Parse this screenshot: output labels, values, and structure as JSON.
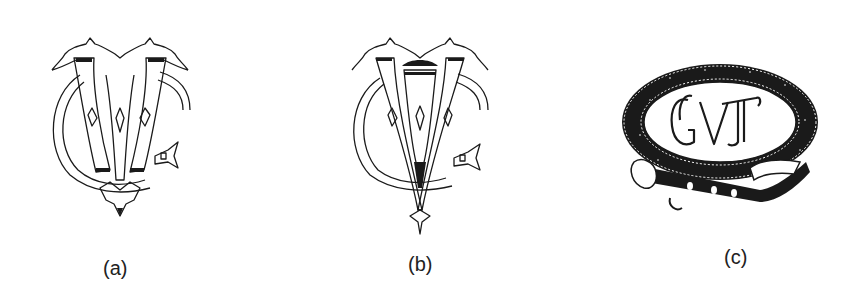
{
  "figure": {
    "panels": [
      {
        "id": "a",
        "label": "(a)",
        "description": "Ornate interlaced monogram with a C-shaped ring, twin stems and a pointed base"
      },
      {
        "id": "b",
        "label": "(b)",
        "description": "Variant of the ornate monogram with a V-shaped stem ending in an arrow point"
      },
      {
        "id": "c",
        "label": "(c)",
        "description": "Monogram letters inside a dark belt/garter ring with buckle"
      }
    ],
    "panel_c_monogram_text": "GVT"
  },
  "colors": {
    "ink": "#1a1a1a",
    "background": "#ffffff"
  }
}
